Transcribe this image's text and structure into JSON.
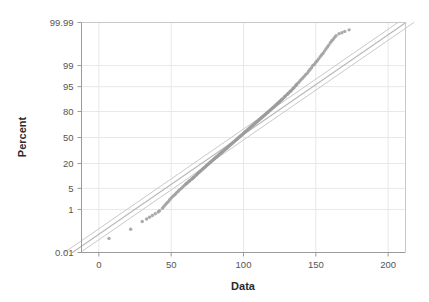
{
  "chart_data": {
    "type": "scatter",
    "title": "",
    "subtitle": "",
    "xlabel": "Data",
    "ylabel": "Percent",
    "plot_kind": "normal-probability-plot",
    "grid": true,
    "legend": "none",
    "xlim": [
      -12,
      212
    ],
    "ylim_percent": [
      0.01,
      99.99
    ],
    "x_ticks": [
      0,
      50,
      100,
      150,
      200
    ],
    "x_tick_labels": [
      "0",
      "50",
      "100",
      "150",
      "200"
    ],
    "y_ticks": [
      0.01,
      1,
      5,
      20,
      50,
      80,
      95,
      99,
      99.99
    ],
    "y_tick_labels": [
      "0.01",
      "1",
      "5",
      "20",
      "50",
      "80",
      "95",
      "99",
      "99.99"
    ],
    "colors": {
      "point": "#9c9c9c",
      "fit_line": "#b8b8b8",
      "ci_band": "#c9c9c9",
      "grid": "#e8e8ec",
      "axis": "#9a9a9a",
      "text": "#555555",
      "title_text": "#2a2a2a",
      "background": "#ffffff"
    },
    "fit_line": {
      "x_at_p50": 97.0,
      "slope_data_per_z": 31.0,
      "mean": 97.0,
      "stdev": 31.0
    },
    "ci_bands": {
      "count": 2,
      "offset_data_units": 5.5,
      "description": "two parallel confidence lines flanking the fitted line"
    },
    "series": [
      {
        "name": "Data",
        "marker": "filled-circle",
        "marker_size_px": 3.4,
        "points_x": [
          7,
          22,
          30,
          33,
          35,
          37,
          39,
          41,
          42,
          44,
          45,
          46,
          47,
          48,
          49,
          50,
          51,
          52,
          53,
          54,
          55,
          56,
          57,
          58,
          59,
          60,
          60.5,
          61,
          62,
          62.5,
          63,
          64,
          64.5,
          65,
          65.5,
          66,
          67,
          67.5,
          68,
          68.5,
          69,
          69.5,
          70,
          70.5,
          71,
          71.5,
          72,
          72.5,
          73,
          73.5,
          74,
          74.5,
          75,
          75.5,
          76,
          76.5,
          77,
          77.5,
          78,
          78.5,
          79,
          79.5,
          80,
          80.5,
          81,
          81.5,
          82,
          82.5,
          83,
          83.5,
          84,
          84.5,
          85,
          85.5,
          86,
          86.5,
          87,
          87.5,
          88,
          88.5,
          89,
          89.5,
          90,
          90.5,
          91,
          91.5,
          92,
          92.5,
          93,
          93.5,
          94,
          94.5,
          95,
          95.5,
          96,
          96.5,
          97,
          97.5,
          98,
          98.5,
          99,
          99.5,
          100,
          100.5,
          101,
          101.5,
          102,
          102.5,
          103,
          103.5,
          104,
          104.5,
          105,
          105.5,
          106,
          106.5,
          107,
          107.5,
          108,
          108.5,
          109,
          109.5,
          110,
          110.5,
          111,
          111.5,
          112,
          112.5,
          113,
          113.5,
          114,
          114.5,
          115,
          115.5,
          116,
          116.5,
          117,
          117.5,
          118,
          118.5,
          119,
          119.5,
          120,
          120.5,
          121,
          121.5,
          122,
          122.5,
          123,
          123.5,
          124,
          124.5,
          125,
          125.5,
          126,
          126.5,
          127,
          128,
          128.5,
          129,
          130,
          130.5,
          131,
          132,
          132.5,
          133,
          134,
          134.5,
          135,
          136,
          136.5,
          137,
          138,
          139,
          140,
          141,
          142,
          143,
          144,
          145,
          146,
          147,
          148,
          149,
          150,
          151,
          152,
          153,
          154,
          155,
          156,
          157,
          158,
          159,
          160,
          161,
          162,
          163,
          164,
          166,
          168,
          170,
          173
        ],
        "points_percent": [
          0.055,
          0.15,
          0.33,
          0.42,
          0.5,
          0.58,
          0.68,
          0.8,
          0.9,
          1.1,
          1.3,
          1.5,
          1.7,
          1.9,
          2.2,
          2.5,
          2.8,
          3.1,
          3.4,
          3.8,
          4.2,
          4.6,
          5.0,
          5.5,
          6.0,
          6.5,
          6.8,
          7.1,
          7.6,
          7.9,
          8.3,
          8.8,
          9.1,
          9.5,
          9.8,
          10.2,
          11.0,
          11.4,
          11.9,
          12.3,
          12.8,
          13.2,
          13.7,
          14.1,
          14.6,
          15.1,
          15.6,
          16.1,
          16.6,
          17.1,
          17.7,
          18.2,
          18.8,
          19.3,
          19.9,
          20.5,
          21.1,
          21.7,
          22.3,
          22.9,
          23.5,
          24.1,
          24.8,
          25.4,
          26.1,
          26.7,
          27.4,
          28.1,
          28.8,
          29.5,
          30.2,
          30.9,
          31.6,
          32.3,
          33.0,
          33.8,
          34.5,
          35.3,
          36.0,
          36.8,
          37.6,
          38.3,
          39.1,
          39.9,
          40.7,
          41.5,
          42.3,
          43.1,
          43.9,
          44.7,
          45.5,
          46.3,
          47.1,
          47.9,
          48.7,
          49.6,
          50.4,
          51.2,
          52.0,
          52.8,
          53.6,
          54.4,
          55.3,
          56.1,
          56.9,
          57.7,
          58.5,
          59.3,
          60.1,
          60.9,
          61.7,
          62.4,
          63.2,
          64.0,
          64.7,
          65.5,
          66.2,
          67.0,
          67.7,
          68.4,
          69.1,
          69.8,
          70.5,
          71.2,
          71.9,
          72.6,
          73.3,
          73.9,
          74.6,
          75.2,
          75.9,
          76.5,
          77.1,
          77.7,
          78.3,
          78.9,
          79.5,
          80.1,
          80.7,
          81.2,
          81.8,
          82.3,
          82.9,
          83.4,
          83.9,
          84.4,
          84.9,
          85.4,
          85.9,
          86.4,
          86.8,
          87.3,
          87.7,
          88.2,
          88.6,
          89.0,
          89.4,
          90.2,
          90.6,
          91.0,
          91.7,
          92.0,
          92.4,
          93.0,
          93.3,
          93.6,
          94.2,
          94.5,
          94.7,
          95.3,
          95.5,
          95.8,
          96.2,
          96.6,
          97.0,
          97.3,
          97.6,
          97.9,
          98.1,
          98.4,
          98.6,
          98.8,
          99.0,
          99.1,
          99.25,
          99.35,
          99.45,
          99.55,
          99.62,
          99.68,
          99.74,
          99.79,
          99.83,
          99.86,
          99.89,
          99.91,
          99.925,
          99.94,
          99.95,
          99.96,
          99.965,
          99.97,
          99.975
        ],
        "n_points": 203,
        "outliers_low": [
          {
            "x": 7,
            "percent": 0.055
          },
          {
            "x": 22,
            "percent": 0.15
          }
        ],
        "outliers_high": [
          {
            "x": 166,
            "percent": 99.96
          },
          {
            "x": 173,
            "percent": 99.975
          }
        ]
      }
    ]
  }
}
